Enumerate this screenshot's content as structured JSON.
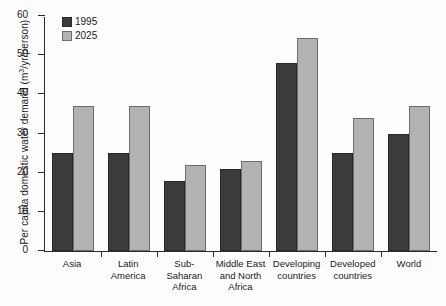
{
  "chart_data": {
    "type": "bar",
    "title": "",
    "xlabel": "",
    "ylabel": "Per capita domestic water demand (m3/yr/person)",
    "ylabel_parts": {
      "prefix": "Per capita domestic water demand (m",
      "sup": "3",
      "suffix": "/yr/person)"
    },
    "categories": [
      "Asia",
      "Latin America",
      "Sub-Saharan Africa",
      "Middle East and North Africa",
      "Developing countries",
      "Developed countries",
      "World"
    ],
    "category_lines": [
      [
        "Asia"
      ],
      [
        "Latin",
        "America"
      ],
      [
        "Sub-Saharan",
        "Africa"
      ],
      [
        "Middle East",
        "and North",
        "Africa"
      ],
      [
        "Developing",
        "countries"
      ],
      [
        "Developed",
        "countries"
      ],
      [
        "World"
      ]
    ],
    "series": [
      {
        "name": "1995",
        "color": "#3b3b3b",
        "values": [
          25,
          25,
          18,
          21,
          48,
          25,
          30
        ]
      },
      {
        "name": "2025",
        "color": "#b2b2b2",
        "values": [
          37,
          37,
          22,
          23,
          54.5,
          34,
          37
        ]
      }
    ],
    "ylim": [
      0,
      60
    ],
    "yticks": [
      0,
      10,
      20,
      30,
      40,
      50,
      60
    ],
    "ytick_labels": [
      "0",
      "10",
      "20",
      "30",
      "40",
      "50",
      "60"
    ],
    "grid": false,
    "legend_position": "top-left"
  },
  "legend": {
    "entries": [
      {
        "label": "1995"
      },
      {
        "label": "2025"
      }
    ]
  }
}
